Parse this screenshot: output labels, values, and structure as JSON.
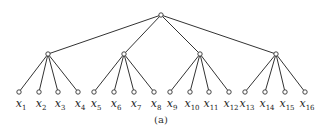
{
  "diagram": {
    "type": "tree",
    "caption": "(a)",
    "root": {
      "x": 161,
      "y": 15
    },
    "level2": [
      {
        "x": 48,
        "y": 54
      },
      {
        "x": 124,
        "y": 54
      },
      {
        "x": 200,
        "y": 54
      },
      {
        "x": 276,
        "y": 54
      }
    ],
    "leaves": [
      {
        "x": 19,
        "label": "x",
        "sub": "1"
      },
      {
        "x": 39,
        "label": "x",
        "sub": "2"
      },
      {
        "x": 58,
        "label": "x",
        "sub": "3"
      },
      {
        "x": 78,
        "label": "x",
        "sub": "4"
      },
      {
        "x": 94,
        "label": "x",
        "sub": "5"
      },
      {
        "x": 114,
        "label": "x",
        "sub": "6"
      },
      {
        "x": 134,
        "label": "x",
        "sub": "7"
      },
      {
        "x": 154,
        "label": "x",
        "sub": "8"
      },
      {
        "x": 170,
        "label": "x",
        "sub": "9"
      },
      {
        "x": 190,
        "label": "x",
        "sub": "10"
      },
      {
        "x": 209,
        "label": "x",
        "sub": "11"
      },
      {
        "x": 229,
        "label": "x",
        "sub": "12"
      },
      {
        "x": 245,
        "label": "x",
        "sub": "13"
      },
      {
        "x": 265,
        "label": "x",
        "sub": "14"
      },
      {
        "x": 285,
        "label": "x",
        "sub": "15"
      },
      {
        "x": 305,
        "label": "x",
        "sub": "16"
      }
    ],
    "leaf_y": 92,
    "colors": {
      "line": "#333333",
      "node_fill": "#ffffff"
    }
  }
}
